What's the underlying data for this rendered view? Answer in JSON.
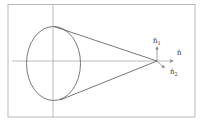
{
  "diagram": {
    "colors": {
      "frame": "#b8b8b8",
      "axis": "#a8a8a8",
      "stroke": "#444444",
      "label": "#333333"
    },
    "labels": {
      "n1": {
        "base": "n̂",
        "sub": "1"
      },
      "n": {
        "base": "n̂",
        "sub": ""
      },
      "n2": {
        "base": "n̂",
        "sub": "2"
      }
    }
  }
}
